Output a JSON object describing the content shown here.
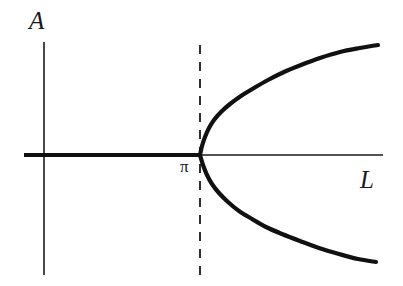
{
  "figure": {
    "background_color": "#ffffff",
    "ink_color": "#1a1a1a",
    "width": 403,
    "height": 286
  },
  "labels": {
    "y_axis": "A",
    "x_axis": "L",
    "bifurcation_point": "π"
  },
  "chart_data": {
    "type": "line",
    "title": "",
    "subtitle": "",
    "xlabel": "L",
    "ylabel": "A",
    "grid": false,
    "legend": null,
    "legend_position": "none",
    "axis_style": "arrowless-cross-axes",
    "origin_pixel": {
      "x": 44,
      "y": 155
    },
    "x_axis_pixel_extent": [
      24,
      383
    ],
    "y_axis_pixel_extent": [
      42,
      275
    ],
    "xlim": [
      -0.6,
      4.4
    ],
    "ylim": [
      -1.4,
      1.4
    ],
    "xticks": [],
    "yticks": [],
    "annotations": [
      {
        "text": "π",
        "meaning": "critical value of L at which the pitchfork bifurcation occurs",
        "x_pixel": 186,
        "y_pixel": 168,
        "data_x": 3.14159,
        "data_y": 0
      }
    ],
    "reference_lines": [
      {
        "name": "critical-L-dashed-line",
        "orientation": "vertical",
        "style": "dashed",
        "data_x": 3.14159,
        "x_pixel": 200,
        "y_pixel_extent": [
          45,
          275
        ],
        "linewidth": 1.8,
        "dash_pattern": "9 8"
      }
    ],
    "series": [
      {
        "name": "trivial-branch",
        "description": "stable zero solution A = 0 for L < π",
        "style": "solid-thick",
        "linewidth": 4.2,
        "points_pixel": [
          [
            24,
            155
          ],
          [
            200,
            155
          ]
        ],
        "x": [
          -0.55,
          3.14159
        ],
        "values": [
          0,
          0
        ]
      },
      {
        "name": "upper-branch",
        "description": "positive amplitude branch emerging at L = π, square-root growth",
        "style": "solid-thick",
        "linewidth": 4.2,
        "points_pixel": [
          [
            200,
            155
          ],
          [
            202,
            146
          ],
          [
            205,
            137
          ],
          [
            209,
            128
          ],
          [
            214,
            120
          ],
          [
            221,
            112
          ],
          [
            230,
            104
          ],
          [
            241,
            96
          ],
          [
            254,
            88
          ],
          [
            268,
            80
          ],
          [
            284,
            72
          ],
          [
            301,
            65
          ],
          [
            320,
            58
          ],
          [
            340,
            52
          ],
          [
            360,
            48
          ],
          [
            378,
            45
          ]
        ],
        "x": [
          3.14159,
          3.18,
          3.24,
          3.33,
          3.44,
          3.58,
          3.77,
          4.0,
          4.27,
          4.57,
          4.9,
          5.26,
          5.65,
          6.07,
          6.49,
          6.87
        ],
        "values": [
          0,
          0.06,
          0.13,
          0.19,
          0.25,
          0.31,
          0.36,
          0.42,
          0.48,
          0.54,
          0.59,
          0.64,
          0.69,
          0.74,
          0.76,
          0.79
        ]
      },
      {
        "name": "lower-branch",
        "description": "negative amplitude branch emerging at L = π, mirror of upper branch",
        "style": "solid-thick",
        "linewidth": 4.2,
        "points_pixel": [
          [
            200,
            155
          ],
          [
            203,
            165
          ],
          [
            207,
            175
          ],
          [
            212,
            184
          ],
          [
            219,
            193
          ],
          [
            228,
            202
          ],
          [
            239,
            211
          ],
          [
            252,
            219
          ],
          [
            266,
            227
          ],
          [
            282,
            234
          ],
          [
            300,
            241
          ],
          [
            319,
            248
          ],
          [
            339,
            254
          ],
          [
            358,
            259
          ],
          [
            376,
            262
          ]
        ],
        "x": [
          3.14159,
          3.2,
          3.27,
          3.37,
          3.51,
          3.69,
          3.92,
          4.19,
          4.48,
          4.82,
          5.2,
          5.6,
          6.01,
          6.42,
          6.8
        ],
        "values": [
          0,
          -0.07,
          -0.14,
          -0.21,
          -0.27,
          -0.34,
          -0.4,
          -0.46,
          -0.51,
          -0.57,
          -0.61,
          -0.66,
          -0.71,
          -0.74,
          -0.76
        ]
      }
    ]
  }
}
